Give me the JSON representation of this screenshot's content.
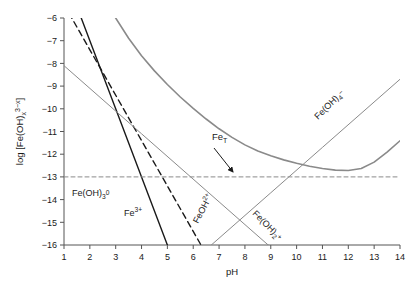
{
  "figure": {
    "name": "iron-hydroxide-speciation-diagram",
    "background": "#ffffff"
  },
  "axes": {
    "x": {
      "label": "pH",
      "min": 1,
      "max": 14,
      "ticks": [
        1,
        2,
        3,
        4,
        5,
        6,
        7,
        8,
        9,
        10,
        11,
        12,
        13,
        14
      ],
      "tick_labels": [
        "1",
        "2",
        "3",
        "4",
        "5",
        "6",
        "7",
        "8",
        "9",
        "10",
        "11",
        "12",
        "13",
        "14"
      ]
    },
    "y": {
      "label_parts": {
        "prefix": "log [Fe(OH)",
        "sub": "x",
        "mid": "",
        "sup": "3−x",
        "suffix": "]"
      },
      "label_plain": "log [Fe(OH)x 3−x]",
      "min": -16,
      "max": -6,
      "ticks": [
        -6,
        -7,
        -8,
        -9,
        -10,
        -11,
        -12,
        -13,
        -14,
        -15,
        -16
      ],
      "tick_labels": [
        "−6",
        "−7",
        "−8",
        "−9",
        "−10",
        "−11",
        "−12",
        "−13",
        "−14",
        "−15",
        "−16"
      ]
    },
    "frame_color": "#555555",
    "grid": false,
    "legend": "none (curves labeled inline)"
  },
  "annotations": [
    {
      "id": "fe3",
      "name": "label-fe3plus",
      "text_parts": {
        "base": "Fe",
        "sup": "3+"
      },
      "text_plain": "Fe3+",
      "x_px": 124,
      "y_px": 216,
      "rotation": 0,
      "color": "#1a1a1a"
    },
    {
      "id": "feoh2",
      "name": "label-feoh2plus",
      "text_parts": {
        "base": "FeOH",
        "sup": "2+"
      },
      "text_plain": "FeOH2+",
      "x_px": 198,
      "y_px": 224,
      "rotation": -62,
      "color": "#1a1a1a"
    },
    {
      "id": "feoh3_0",
      "name": "label-feoh3-neutral",
      "text_parts": {
        "base": "Fe(OH)",
        "sub": "3",
        "sup": "0"
      },
      "text_plain": "Fe(OH)3 0",
      "x_px": 72,
      "y_px": 196,
      "rotation": 0,
      "color": "#1a1a1a"
    },
    {
      "id": "feoh2_plus",
      "name": "label-feoh2-plus-cation",
      "text_parts": {
        "base": "Fe(OH)",
        "sub": "2",
        "sup": "+"
      },
      "text_plain": "Fe(OH)2 +",
      "x_px": 252,
      "y_px": 214,
      "rotation": 45,
      "color": "#1a1a1a"
    },
    {
      "id": "feoh4",
      "name": "label-feoh4-minus",
      "text_parts": {
        "base": "Fe(OH)",
        "sub": "4",
        "sup": "−"
      },
      "text_plain": "Fe(OH)4 -",
      "x_px": 318,
      "y_px": 120,
      "rotation": -45,
      "color": "#1a1a1a"
    },
    {
      "id": "fet",
      "name": "label-fe-total",
      "text_parts": {
        "base": "Fe",
        "sub": "T"
      },
      "text_plain": "FeT",
      "x_px": 212,
      "y_px": 140,
      "rotation": 0,
      "color": "#1a1a1a"
    }
  ],
  "arrow": {
    "name": "fe-total-pointer-arrow",
    "from_x_px": 214,
    "from_y_px": 148,
    "to_x_px": 233,
    "to_y_px": 172,
    "color": "#1a1a1a"
  },
  "chart_data": {
    "type": "line",
    "title": "",
    "subtitle": "",
    "xlabel": "pH",
    "ylabel": "log [Fe(OH)x 3−x]",
    "xlim": [
      1,
      14
    ],
    "ylim": [
      -16,
      -6
    ],
    "grid": false,
    "legend_position": "inline-labels",
    "series": [
      {
        "name": "Fe3+",
        "label": "Fe3+",
        "style": "solid",
        "color": "#1a1a1a",
        "width": 1.4,
        "slope": -3.0,
        "intercept_at_pH0": -1.0,
        "comment": "log[Fe3+] = -1 - 3*pH ; drawn from top frame to y=-16",
        "x": [
          1.0,
          1.667,
          2.0,
          3.0,
          4.0,
          5.0
        ],
        "y": [
          -4.0,
          -6.0,
          -7.0,
          -10.0,
          -13.0,
          -16.0
        ]
      },
      {
        "name": "FeOH2+",
        "label": "FeOH2+",
        "style": "dashed",
        "color": "#1a1a1a",
        "width": 1.4,
        "slope": -2.0,
        "intercept_at_pH0": -3.4,
        "comment": "log[FeOH2+] = -3.4 - 2*pH",
        "x": [
          1.0,
          1.3,
          2.0,
          4.0,
          6.0,
          6.3
        ],
        "y": [
          -5.4,
          -6.0,
          -7.4,
          -11.4,
          -15.4,
          -16.0
        ]
      },
      {
        "name": "Fe(OH)2+",
        "label": "Fe(OH)2+",
        "style": "solid",
        "color": "#8a8a8a",
        "width": 1.0,
        "slope": -1.0,
        "intercept_at_pH0": -7.1,
        "comment": "log[Fe(OH)2+] = -7.1 - pH ; shallow gray line",
        "x": [
          1.0,
          4.0,
          7.0,
          9.0,
          8.9
        ],
        "y": [
          -8.1,
          -11.1,
          -14.1,
          -16.1,
          -16.0
        ]
      },
      {
        "name": "Fe(OH)3 0",
        "label": "Fe(OH)3 0",
        "style": "dashed",
        "color": "#8a8a8a",
        "width": 1.0,
        "slope": 0.0,
        "intercept_at_pH0": -13.0,
        "comment": "constant saturation value log[Fe(OH)3 0] = -13 across all pH",
        "x": [
          1.0,
          14.0
        ],
        "y": [
          -13.0,
          -13.0
        ]
      },
      {
        "name": "Fe(OH)4-",
        "label": "Fe(OH)4-",
        "style": "solid",
        "color": "#8a8a8a",
        "width": 1.0,
        "slope": 1.0,
        "intercept_at_pH0": -22.7,
        "comment": "log[Fe(OH)4-] = -22.7 + pH",
        "x": [
          6.7,
          9.0,
          11.0,
          14.0
        ],
        "y": [
          -16.0,
          -13.7,
          -11.7,
          -8.7
        ]
      },
      {
        "name": "FeT",
        "label": "FeT",
        "style": "solid",
        "color": "#8a8a8a",
        "width": 1.6,
        "comment": "total dissolved Fe = sum of all species; envelope curve with flat minimum near -13 between pH 7 and 9",
        "x": [
          1.0,
          1.5,
          2.0,
          2.5,
          3.0,
          3.5,
          4.0,
          4.5,
          5.0,
          5.5,
          6.0,
          6.5,
          7.0,
          7.5,
          8.0,
          8.5,
          9.0,
          9.5,
          10.0,
          10.5,
          11.0,
          11.5,
          12.0,
          12.5,
          13.0,
          13.5,
          14.0
        ],
        "y": [
          -0.96,
          -2.38,
          -3.73,
          -4.95,
          -6.0,
          -6.89,
          -7.66,
          -8.33,
          -8.93,
          -9.48,
          -9.98,
          -10.45,
          -10.88,
          -11.26,
          -11.59,
          -11.86,
          -12.07,
          -12.25,
          -12.4,
          -12.53,
          -12.63,
          -12.7,
          -12.72,
          -12.63,
          -12.35,
          -11.91,
          -11.41
        ]
      }
    ],
    "key_features": {
      "solubility_minimum_value": -13,
      "solubility_minimum_pH_range": [
        7.0,
        9.0
      ],
      "amphoteric": true,
      "dashed_reference_line_y": -13
    }
  }
}
